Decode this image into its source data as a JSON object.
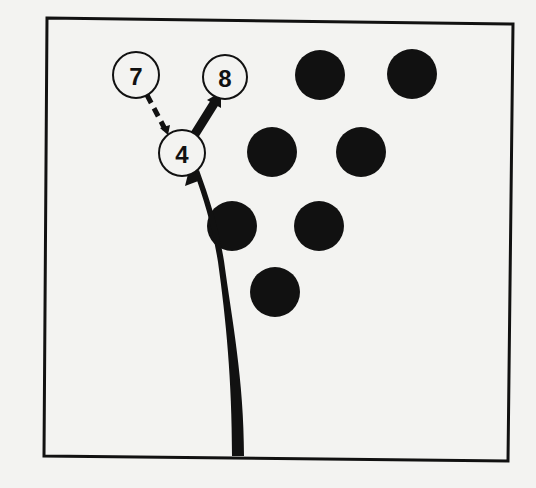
{
  "diagram": {
    "title": "",
    "frame": {
      "points": [
        [
          47,
          18
        ],
        [
          513,
          24
        ],
        [
          508,
          461
        ],
        [
          44,
          456
        ]
      ],
      "stroke": "#111111"
    },
    "colors": {
      "background": "#f3f3f1",
      "ink": "#111111",
      "open_pin_fill": "#f3f3f1"
    },
    "standing_pins": [
      {
        "id": "s1",
        "cx": 320,
        "cy": 75,
        "r": 25
      },
      {
        "id": "s2",
        "cx": 412,
        "cy": 74,
        "r": 25
      },
      {
        "id": "s3",
        "cx": 272,
        "cy": 152,
        "r": 25
      },
      {
        "id": "s4",
        "cx": 361,
        "cy": 152,
        "r": 25
      },
      {
        "id": "s5",
        "cx": 232,
        "cy": 226,
        "r": 25
      },
      {
        "id": "s6",
        "cx": 319,
        "cy": 226,
        "r": 25
      },
      {
        "id": "s7",
        "cx": 275,
        "cy": 292,
        "r": 25
      }
    ],
    "labeled_pins": [
      {
        "id": "pin7",
        "label": "7",
        "cx": 136,
        "cy": 75,
        "r": 23
      },
      {
        "id": "pin8",
        "label": "8",
        "cx": 225,
        "cy": 77,
        "r": 22
      },
      {
        "id": "pin4",
        "label": "4",
        "cx": 182,
        "cy": 153,
        "r": 23
      }
    ],
    "paths": {
      "ball_path": {
        "description": "ball trajectory into pin 4",
        "style": "thick-solid-arrow"
      },
      "pin4_to_pin8": {
        "description": "pin 4 deflects to pin 8",
        "style": "thick-solid-arrow"
      },
      "pin4_to_pin7": {
        "description": "pin 4 to pin 7",
        "style": "dashed-line"
      }
    }
  }
}
